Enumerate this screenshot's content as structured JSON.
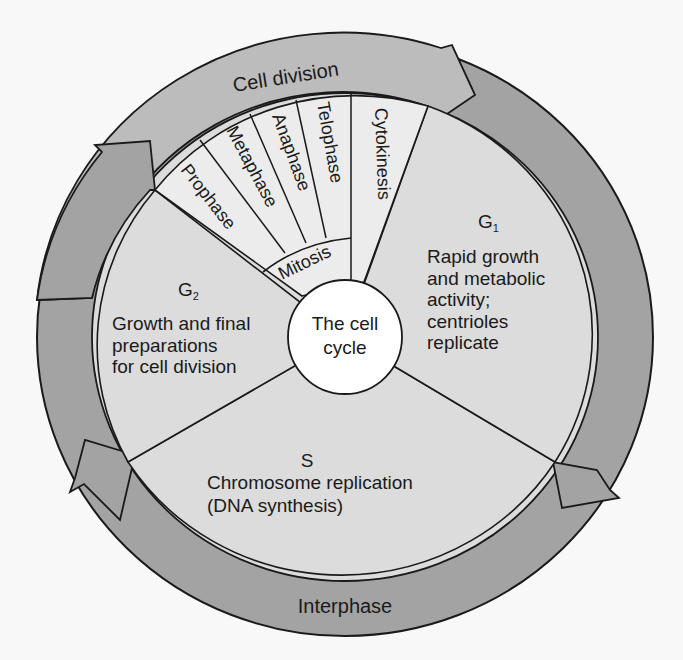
{
  "diagram": {
    "title": "The cell cycle",
    "center_label": {
      "line1": "The cell",
      "line2": "cycle"
    },
    "outer_ring": {
      "cell_division_label": "Cell division",
      "interphase_label": "Interphase"
    },
    "mitosis": {
      "label": "Mitosis",
      "stages": [
        "Prophase",
        "Metaphase",
        "Anaphase",
        "Telophase"
      ]
    },
    "cytokinesis": {
      "label": "Cytokinesis"
    },
    "phases": {
      "g1": {
        "name": "G",
        "subscript": "1",
        "lines": [
          "Rapid growth",
          "and metabolic",
          "activity;",
          "centrioles",
          "replicate"
        ]
      },
      "s": {
        "name": "S",
        "lines": [
          "Chromosome replication",
          "(DNA synthesis)"
        ]
      },
      "g2": {
        "name": "G",
        "subscript": "2",
        "lines": [
          "Growth and final",
          "preparations",
          "for cell division"
        ]
      }
    },
    "colors": {
      "background": "#f8f8f8",
      "interphase_arrow": "#a3a3a3",
      "cell_division_arrow": "#bcbcbc",
      "sector_fill": "#dcdcdc",
      "mitosis_fill": "#ececec",
      "center_fill": "#ffffff",
      "stroke": "#1a1a1a"
    }
  }
}
